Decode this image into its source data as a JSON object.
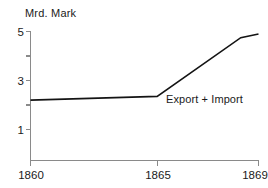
{
  "chart_data": {
    "type": "line",
    "title": "Mrd. Mark",
    "xlabel": "",
    "ylabel": "Mrd. Mark",
    "xlim": [
      1860,
      1869
    ],
    "ylim": [
      0,
      5
    ],
    "grid": false,
    "legend_position": "inline-annotation",
    "x_ticks": [
      {
        "value": 1860,
        "label": "1860"
      },
      {
        "value": 1865,
        "label": "1865"
      },
      {
        "value": 1869,
        "label": "1869"
      }
    ],
    "y_ticks": [
      {
        "value": 5,
        "label": "5"
      },
      {
        "value": 4,
        "label": ""
      },
      {
        "value": 3,
        "label": "3"
      },
      {
        "value": 2,
        "label": ""
      },
      {
        "value": 1,
        "label": "1"
      }
    ],
    "series": [
      {
        "name": "Export + Import",
        "annotation": "Export + Import",
        "color": "#141414",
        "x": [
          1860,
          1865,
          1868.3,
          1869
        ],
        "values": [
          2.2,
          2.35,
          4.75,
          4.9
        ]
      }
    ]
  },
  "annotations": {
    "series_label": "Export + Import"
  }
}
